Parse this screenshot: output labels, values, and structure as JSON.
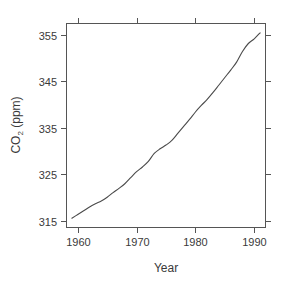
{
  "chart_data": {
    "type": "line",
    "title": "",
    "xlabel": "Year",
    "ylabel": "CO2 (ppm)",
    "ylabel_base": "CO",
    "ylabel_subscript": "2",
    "ylabel_unit": " (ppm)",
    "xlim": [
      1958.0,
      1992.0
    ],
    "ylim": [
      313.5,
      357.5
    ],
    "grid": false,
    "legend": null,
    "xticks": [
      1960,
      1970,
      1980,
      1990
    ],
    "xtick_labels": [
      "1960",
      "1970",
      "1980",
      "1990"
    ],
    "yticks": [
      315,
      325,
      335,
      345,
      355
    ],
    "ytick_labels": [
      "315",
      "325",
      "335",
      "345",
      "355"
    ],
    "line_color": "#4a4a4a",
    "background_color": "#ffffff",
    "frame": "box-all-sides-outward-ticks",
    "series": [
      {
        "name": "Mauna Loa CO2 annual mean",
        "x": [
          1959,
          1960,
          1961,
          1962,
          1963,
          1964,
          1965,
          1966,
          1967,
          1968,
          1969,
          1970,
          1971,
          1972,
          1973,
          1974,
          1975,
          1976,
          1977,
          1978,
          1979,
          1980,
          1981,
          1982,
          1983,
          1984,
          1985,
          1986,
          1987,
          1988,
          1989,
          1990,
          1991
        ],
        "values": [
          315.6,
          316.4,
          317.2,
          318.0,
          318.7,
          319.3,
          320.1,
          321.1,
          322.0,
          323.0,
          324.3,
          325.6,
          326.6,
          327.8,
          329.5,
          330.5,
          331.3,
          332.3,
          333.8,
          335.3,
          336.8,
          338.4,
          339.8,
          341.1,
          342.6,
          344.2,
          345.8,
          347.4,
          349.1,
          351.4,
          353.1,
          354.1,
          355.4
        ],
        "units": "ppm"
      }
    ]
  },
  "axes_geometry": {
    "plot_left": 66,
    "plot_right": 266,
    "plot_top": 23,
    "plot_bottom": 228
  }
}
